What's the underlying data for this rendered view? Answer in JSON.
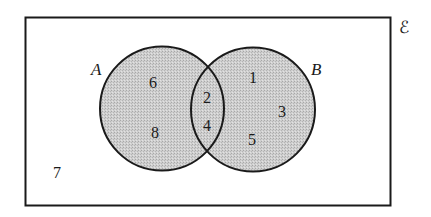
{
  "diagram": {
    "type": "venn",
    "universal_set": {
      "symbol": "ℰ",
      "label": "universal-set"
    },
    "sets": [
      {
        "name": "A",
        "label": "A"
      },
      {
        "name": "B",
        "label": "B"
      }
    ],
    "regions": {
      "only_A": [
        "6",
        "8"
      ],
      "A_and_B": [
        "2",
        "4"
      ],
      "only_B": [
        "1",
        "3",
        "5"
      ],
      "outside": [
        "7"
      ]
    },
    "colors": {
      "circle_fill": "#c8c8c8",
      "stroke": "#1a1a1a",
      "background": "#ffffff"
    }
  }
}
